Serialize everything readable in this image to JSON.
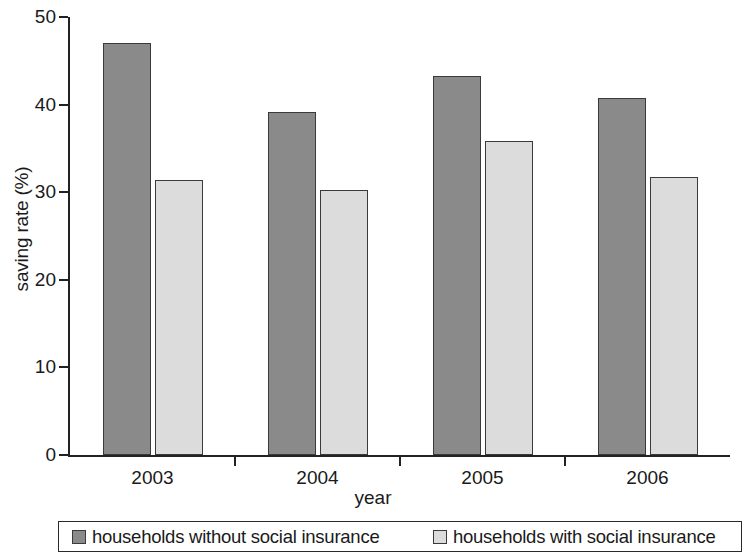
{
  "chart_data": {
    "type": "bar",
    "title": "",
    "subtitle": "",
    "xlabel": "year",
    "ylabel": "saving rate (%)",
    "categories": [
      "2003",
      "2004",
      "2005",
      "2006"
    ],
    "series": [
      {
        "name": "households without social insurance",
        "color": "#8a8a8a",
        "values": [
          47.0,
          39.2,
          43.3,
          40.8
        ]
      },
      {
        "name": "households with social insurance",
        "color": "#dcdcdc",
        "values": [
          31.4,
          30.2,
          35.8,
          31.7
        ]
      }
    ],
    "ylim": [
      0,
      50
    ],
    "yticks": [
      0,
      10,
      20,
      30,
      40,
      50
    ],
    "ytick_labels": [
      "0",
      "10",
      "20",
      "30",
      "40",
      "50"
    ],
    "xtick_labels": [
      "2003",
      "2004",
      "2005",
      "2006"
    ],
    "grid": false,
    "legend_position": "bottom",
    "legend_entries": [
      "households without social insurance",
      "households with social insurance"
    ]
  },
  "axes": {
    "y_axis_label": "saving rate (%)",
    "x_axis_label": "year"
  }
}
